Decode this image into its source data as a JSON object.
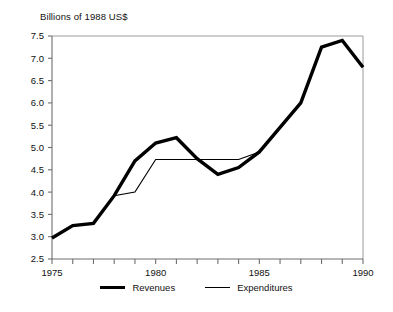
{
  "chart_data": {
    "type": "line",
    "title": "Billions of 1988 US$",
    "xlabel": "",
    "ylabel": "",
    "xlim": [
      1975,
      1990
    ],
    "ylim": [
      2.5,
      7.5
    ],
    "yticks": [
      2.5,
      3.0,
      3.5,
      4.0,
      4.5,
      5.0,
      5.5,
      6.0,
      6.5,
      7.0,
      7.5
    ],
    "ytick_labels": [
      "2.5",
      "3.0",
      "3.5",
      "4.0",
      "4.5",
      "5.0",
      "5.5",
      "6.0",
      "6.5",
      "7.0",
      "7.5"
    ],
    "xticks": [
      1975,
      1976,
      1977,
      1978,
      1979,
      1980,
      1981,
      1982,
      1983,
      1984,
      1985,
      1986,
      1987,
      1988,
      1989,
      1990
    ],
    "xtick_labels": [
      "1975",
      "",
      "",
      "",
      "",
      "1980",
      "",
      "",
      "",
      "",
      "1985",
      "",
      "",
      "",
      "",
      "1990"
    ],
    "grid": false,
    "legend_position": "bottom",
    "x": [
      1975,
      1976,
      1977,
      1978,
      1979,
      1980,
      1981,
      1982,
      1983,
      1984,
      1985,
      1986,
      1987,
      1988,
      1989,
      1990
    ],
    "series": [
      {
        "name": "Revenues",
        "line_style": "thick",
        "color": "#000000",
        "values": [
          2.97,
          3.25,
          3.3,
          3.92,
          4.7,
          5.1,
          5.22,
          4.75,
          4.4,
          4.55,
          4.9,
          5.45,
          6.0,
          7.25,
          7.4,
          6.8
        ]
      },
      {
        "name": "Expenditures",
        "line_style": "thin",
        "color": "#000000",
        "values": [
          2.97,
          3.25,
          3.3,
          3.92,
          4.0,
          4.73,
          4.73,
          4.73,
          4.73,
          4.73,
          4.9,
          5.45,
          6.0,
          7.25,
          7.4,
          6.8
        ]
      }
    ]
  },
  "legend": {
    "entries": [
      {
        "label": "Revenues"
      },
      {
        "label": "Expenditures"
      }
    ]
  }
}
